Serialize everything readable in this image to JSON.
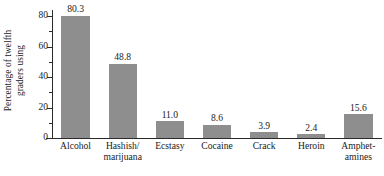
{
  "chart_data": {
    "type": "bar",
    "title": "",
    "xlabel": "",
    "ylabel": "Percentage of twelfth graders using",
    "ylabel_lines": [
      "Percentage of twelfth",
      "graders using"
    ],
    "categories": [
      "Alcohol",
      "Hashish/ marijuana",
      "Ecstasy",
      "Cocaine",
      "Crack",
      "Heroin",
      "Amphet- amines"
    ],
    "category_lines": [
      [
        "Alcohol"
      ],
      [
        "Hashish/",
        "marijuana"
      ],
      [
        "Ecstasy"
      ],
      [
        "Cocaine"
      ],
      [
        "Crack"
      ],
      [
        "Heroin"
      ],
      [
        "Amphet-",
        "amines"
      ]
    ],
    "values": [
      80.3,
      48.8,
      11.0,
      8.6,
      3.9,
      2.4,
      15.6
    ],
    "value_labels": [
      "80.3",
      "48.8",
      "11.0",
      "8.6",
      "3.9",
      "2.4",
      "15.6"
    ],
    "ylim": [
      0,
      84
    ],
    "yticks": [
      0,
      20,
      40,
      60,
      80
    ],
    "ytick_labels": [
      "0",
      "20",
      "40",
      "60",
      "80"
    ],
    "yminorticks": [
      10,
      30,
      50,
      70
    ],
    "grid": false,
    "legend": null,
    "bar_color": "#8e8e8e",
    "axis_color": "#2b2b2b",
    "text_color": "#1a1a1a",
    "background": "#ffffff"
  }
}
